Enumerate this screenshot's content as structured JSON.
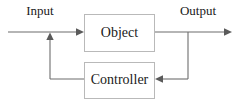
{
  "diagram": {
    "canvas": {
      "width": 239,
      "height": 107,
      "background": "#ffffff"
    },
    "colors": {
      "line": "#6d6d6d",
      "arrow": "#5a5a5a",
      "box_border": "#b9b9b9",
      "box_fill": "#ffffff",
      "text": "#1a1a1a"
    },
    "blocks": [
      {
        "id": "object",
        "label": "Object",
        "x": 84,
        "y": 14,
        "width": 71,
        "height": 38
      },
      {
        "id": "controller",
        "label": "Controller",
        "x": 84,
        "y": 62,
        "width": 71,
        "height": 37
      }
    ],
    "signals": [
      {
        "id": "input",
        "label": "Input"
      },
      {
        "id": "output",
        "label": "Output"
      }
    ],
    "connections": [
      {
        "id": "input-to-object",
        "from": "input",
        "to": "object",
        "direction": "right"
      },
      {
        "id": "object-to-output",
        "from": "object",
        "to": "output",
        "direction": "right"
      },
      {
        "id": "output-to-controller",
        "from": "output",
        "to": "controller",
        "direction": "left"
      },
      {
        "id": "controller-to-summing",
        "from": "controller",
        "to": "summing-junction",
        "direction": "up"
      }
    ]
  }
}
